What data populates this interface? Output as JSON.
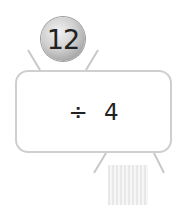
{
  "machine": {
    "input_value": "12",
    "operation": "÷ 4",
    "output_value": ""
  },
  "colors": {
    "outline": "#cfcfcf",
    "ball": "#c8c8c8",
    "text": "#222222"
  }
}
